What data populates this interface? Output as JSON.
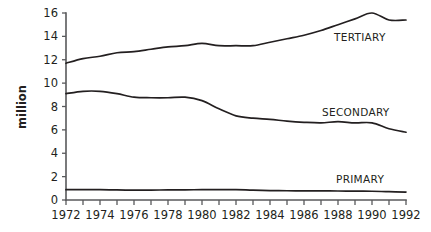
{
  "chart_data": {
    "type": "line",
    "title": "",
    "xlabel": "",
    "ylabel": "million",
    "xlim": [
      1972,
      1992
    ],
    "ylim": [
      0,
      16
    ],
    "grid": false,
    "legend_position": "inline-right",
    "y_ticks": [
      0,
      2,
      4,
      6,
      8,
      10,
      12,
      14,
      16
    ],
    "y_tick_labels": [
      "0",
      "2",
      "4",
      "6",
      "8",
      "10",
      "12",
      "14",
      "16"
    ],
    "x_ticks": [
      1972,
      1973,
      1974,
      1975,
      1976,
      1977,
      1978,
      1979,
      1980,
      1981,
      1982,
      1983,
      1984,
      1985,
      1986,
      1987,
      1988,
      1989,
      1990,
      1991,
      1992
    ],
    "x_tick_labels_shown": [
      "1972",
      "1974",
      "1976",
      "1978",
      "1980",
      "1982",
      "1984",
      "1986",
      "1988",
      "1990",
      "1992"
    ],
    "x": [
      1972,
      1973,
      1974,
      1975,
      1976,
      1977,
      1978,
      1979,
      1980,
      1981,
      1982,
      1983,
      1984,
      1985,
      1986,
      1987,
      1988,
      1989,
      1990,
      1991,
      1992
    ],
    "series": [
      {
        "name": "TERTIARY",
        "label": "TERTIARY",
        "color": "#231f20",
        "values": [
          11.7,
          12.1,
          12.3,
          12.6,
          12.7,
          12.9,
          13.1,
          13.2,
          13.4,
          13.2,
          13.2,
          13.2,
          13.5,
          13.8,
          14.1,
          14.5,
          15.0,
          15.5,
          16.0,
          15.4,
          15.4
        ]
      },
      {
        "name": "SECONDARY",
        "label": "SECONDARY",
        "color": "#231f20",
        "values": [
          9.1,
          9.3,
          9.3,
          9.1,
          8.8,
          8.75,
          8.75,
          8.8,
          8.5,
          7.8,
          7.2,
          7.0,
          6.9,
          6.75,
          6.65,
          6.6,
          6.7,
          6.6,
          6.6,
          6.1,
          5.8
        ]
      },
      {
        "name": "PRIMARY",
        "label": "PRIMARY",
        "color": "#231f20",
        "values": [
          0.88,
          0.88,
          0.89,
          0.86,
          0.85,
          0.85,
          0.86,
          0.87,
          0.88,
          0.88,
          0.89,
          0.84,
          0.81,
          0.79,
          0.78,
          0.78,
          0.77,
          0.76,
          0.75,
          0.71,
          0.68
        ]
      }
    ]
  },
  "labels": {
    "tertiary": "TERTIARY",
    "secondary": "SECONDARY",
    "primary": "PRIMARY",
    "y_axis_title": "million"
  }
}
